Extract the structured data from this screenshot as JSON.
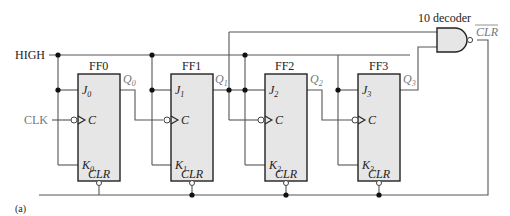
{
  "diagram": {
    "figure_label": "(a)",
    "inputs": {
      "high": "HIGH",
      "clk": "CLK"
    },
    "decoder": {
      "label": "10 decoder",
      "output_label": "CLR",
      "output_overline": true,
      "gate_type": "NAND"
    },
    "flipflops": [
      {
        "name": "FF0",
        "j": "J",
        "j_sub": "0",
        "k": "K",
        "k_sub": "0",
        "c": "C",
        "clr": "CLR",
        "q": "Q",
        "q_sub": "0"
      },
      {
        "name": "FF1",
        "j": "J",
        "j_sub": "1",
        "k": "K",
        "k_sub": "1",
        "c": "C",
        "clr": "CLR",
        "q": "Q",
        "q_sub": "1"
      },
      {
        "name": "FF2",
        "j": "J",
        "j_sub": "2",
        "k": "K",
        "k_sub": "2",
        "c": "C",
        "clr": "CLR",
        "q": "Q",
        "q_sub": "2"
      },
      {
        "name": "FF3",
        "j": "J",
        "j_sub": "3",
        "k": "K",
        "k_sub": "3",
        "c": "C",
        "clr": "CLR",
        "q": "Q",
        "q_sub": "3"
      }
    ]
  }
}
